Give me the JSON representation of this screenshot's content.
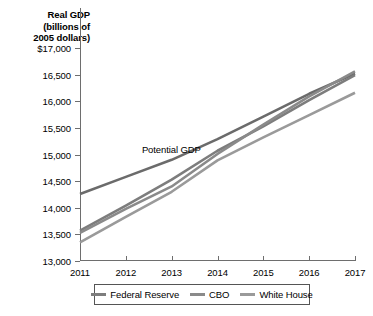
{
  "chart_data": {
    "type": "line",
    "title": "Real GDP (billions of 2005 dollars)",
    "title_lines": [
      "Real GDP",
      "(billions of",
      "2005 dollars)"
    ],
    "xlabel": "",
    "ylabel": "Real GDP (billions of 2005 dollars)",
    "x": [
      2011,
      2012,
      2013,
      2014,
      2015,
      2016,
      2017
    ],
    "xtick_labels": [
      "2011",
      "2012",
      "2013",
      "2014",
      "2015",
      "2016",
      "2017"
    ],
    "ytick_values": [
      13000,
      13500,
      14000,
      14500,
      15000,
      15500,
      16000,
      16500,
      17000
    ],
    "ytick_labels": [
      "13,000",
      "13,500",
      "14,000",
      "14,500",
      "15,000",
      "15,500",
      "16,000",
      "16,500",
      "$17,000"
    ],
    "ylim": [
      13000,
      17000
    ],
    "xlim": [
      2011,
      2017
    ],
    "grid": false,
    "legend_position": "bottom",
    "annotations": [
      {
        "text": "Potential GDP",
        "x": 2012.35,
        "y": 15060
      }
    ],
    "series": [
      {
        "name": "Potential GDP",
        "color": "#6b6b6b",
        "values": [
          14260,
          14580,
          14900,
          15290,
          15710,
          16140,
          16520
        ]
      },
      {
        "name": "Federal Reserve",
        "color": "#7d7d7d",
        "values": [
          13570,
          14040,
          14530,
          15070,
          15530,
          16020,
          16490
        ]
      },
      {
        "name": "CBO",
        "color": "#8a8a8a",
        "values": [
          13530,
          13980,
          14400,
          15010,
          15560,
          16090,
          16560
        ]
      },
      {
        "name": "White House",
        "color": "#9a9a9a",
        "values": [
          13350,
          13830,
          14300,
          14890,
          15320,
          15740,
          16160
        ]
      }
    ]
  },
  "legend": {
    "items": [
      {
        "label": "Federal Reserve",
        "color": "#7d7d7d"
      },
      {
        "label": "CBO",
        "color": "#8a8a8a"
      },
      {
        "label": "White House",
        "color": "#9a9a9a"
      }
    ]
  }
}
